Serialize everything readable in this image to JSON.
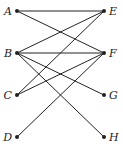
{
  "diagram": {
    "type": "bipartite-graph",
    "nodes": [
      {
        "id": "A",
        "label": "A",
        "x": 17,
        "y": 11,
        "side": "left"
      },
      {
        "id": "B",
        "label": "B",
        "x": 17,
        "y": 53,
        "side": "left"
      },
      {
        "id": "C",
        "label": "C",
        "x": 17,
        "y": 95,
        "side": "left"
      },
      {
        "id": "D",
        "label": "D",
        "x": 17,
        "y": 137,
        "side": "left"
      },
      {
        "id": "E",
        "label": "E",
        "x": 104,
        "y": 11,
        "side": "right"
      },
      {
        "id": "F",
        "label": "F",
        "x": 104,
        "y": 53,
        "side": "right"
      },
      {
        "id": "G",
        "label": "G",
        "x": 104,
        "y": 95,
        "side": "right"
      },
      {
        "id": "H",
        "label": "H",
        "x": 104,
        "y": 137,
        "side": "right"
      }
    ],
    "edges": [
      [
        "A",
        "E"
      ],
      [
        "A",
        "F"
      ],
      [
        "B",
        "E"
      ],
      [
        "B",
        "F"
      ],
      [
        "B",
        "G"
      ],
      [
        "B",
        "H"
      ],
      [
        "C",
        "E"
      ],
      [
        "C",
        "F"
      ],
      [
        "D",
        "F"
      ]
    ],
    "line_color": "#222222"
  }
}
